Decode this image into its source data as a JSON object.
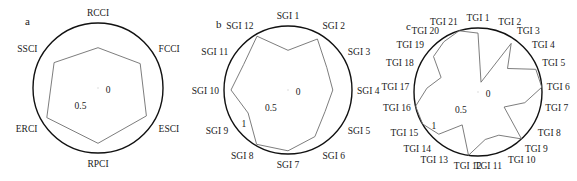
{
  "figure": {
    "panels": [
      "a",
      "b",
      "c"
    ]
  },
  "chart_data": [
    {
      "type": "radar",
      "panel_label": "a",
      "title": "",
      "categories": [
        "RCCI",
        "FCCI",
        "ESCI",
        "RPCI",
        "ERCI",
        "SSCI"
      ],
      "values": [
        0.62,
        0.75,
        0.86,
        0.85,
        0.91,
        0.78
      ],
      "tick_labels": [
        "0",
        "0.5"
      ],
      "range": [
        0,
        1
      ],
      "grid": false,
      "layout": {
        "cx": 98,
        "cy": 88,
        "r": 65
      }
    },
    {
      "type": "radar",
      "panel_label": "b",
      "title": "",
      "categories": [
        "SGI 1",
        "SGI 2",
        "SGI 3",
        "SGI 4",
        "SGI 5",
        "SGI 6",
        "SGI 7",
        "SGI 8",
        "SGI 9",
        "SGI 10",
        "SGI 11",
        "SGI 12"
      ],
      "values": [
        0.62,
        0.92,
        0.7,
        0.7,
        0.67,
        0.84,
        0.95,
        0.98,
        0.72,
        0.89,
        0.8,
        0.97
      ],
      "tick_labels": [
        "0",
        "0.5",
        "1"
      ],
      "range": [
        0,
        1
      ],
      "grid": false,
      "layout": {
        "cx": 288,
        "cy": 90,
        "r": 64
      }
    },
    {
      "type": "radar",
      "panel_label": "c",
      "title": "",
      "categories": [
        "TGI 1",
        "TGI 2",
        "TGI 3",
        "TGI 4",
        "TGI 5",
        "TGI 6",
        "TGI 7",
        "TGI 8",
        "TGI 9",
        "TGI 10",
        "TGI 11",
        "TGI 12",
        "TGI 13",
        "TGI 14",
        "TGI 15",
        "TGI 16",
        "TGI 17",
        "TGI 18",
        "TGI 19",
        "TGI 20",
        "TGI 21"
      ],
      "values": [
        0.92,
        0.16,
        0.92,
        0.59,
        0.97,
        1.0,
        0.75,
        0.47,
        1.0,
        0.75,
        0.75,
        1.0,
        0.57,
        0.9,
        1.0,
        1.0,
        0.8,
        0.62,
        0.89,
        0.95,
        1.0
      ],
      "tick_labels": [
        "0",
        "0.5",
        "1"
      ],
      "range": [
        0,
        1
      ],
      "grid": false,
      "layout": {
        "cx": 478,
        "cy": 92,
        "r": 64
      }
    }
  ],
  "colors": {
    "background": "#ffffff",
    "frame": "#111111",
    "series_line": "#6e6e6e",
    "text": "#1a1a1a"
  }
}
